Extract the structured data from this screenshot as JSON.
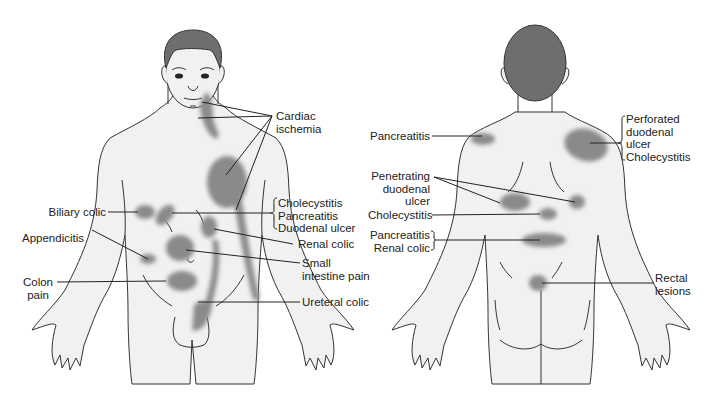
{
  "figure": {
    "colors": {
      "skin": "#f1f1f1",
      "outline": "#333333",
      "hair": "#6e6e6e",
      "pain_area": "#8a8a8a",
      "leader_line": "#222222",
      "label_text": "#222222"
    }
  },
  "front_view": {
    "labels": {
      "cardiac": "Cardiac\nischemia",
      "chole_group": "Cholecystitis\nPancreatitis\nDuodenal ulcer",
      "biliary": "Biliary colic",
      "appendicitis": "Appendicitis",
      "renal": "Renal colic",
      "small_intestine": "Small\nintestine pain",
      "colon": "Colon\npain",
      "ureteral": "Ureteral colic"
    }
  },
  "back_view": {
    "labels": {
      "pancreatitis": "Pancreatitis",
      "perforated": "Perforated\nduodenal\nulcer\nCholecystitis",
      "penetrating": "Penetrating\nduodenal\nulcer",
      "cholecystitis": "Cholecystitis",
      "panc_renal": "Pancreatitis\nRenal colic",
      "rectal": "Rectal\nlesions"
    }
  }
}
